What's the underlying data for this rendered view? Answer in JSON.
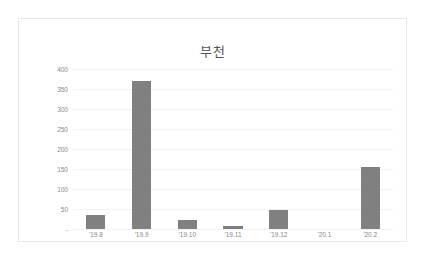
{
  "chart_data": {
    "type": "bar",
    "title": "부천",
    "xlabel": "",
    "ylabel": "",
    "categories": [
      "'19.8",
      "'19.9",
      "'19.10",
      "'19.11",
      "'19.12",
      "'20.1",
      "'20.2"
    ],
    "values": [
      35,
      370,
      22,
      8,
      48,
      0,
      155
    ],
    "ylim": [
      0,
      400
    ],
    "ytick_labels": [
      "400",
      "350",
      "300",
      "250",
      "200",
      "150",
      "100",
      "50",
      "-"
    ],
    "ytick_values": [
      400,
      350,
      300,
      250,
      200,
      150,
      100,
      50,
      0
    ],
    "grid": true,
    "legend": false,
    "series": [
      {
        "name": "부천",
        "values": [
          35,
          370,
          22,
          8,
          48,
          0,
          155
        ]
      }
    ],
    "colors": {
      "bar": "#808080",
      "gridline": "#f2f2f2",
      "tick_text": "#8a8a8a",
      "title_text": "#555555",
      "frame_border": "#e8e8e8",
      "background": "#ffffff"
    }
  }
}
